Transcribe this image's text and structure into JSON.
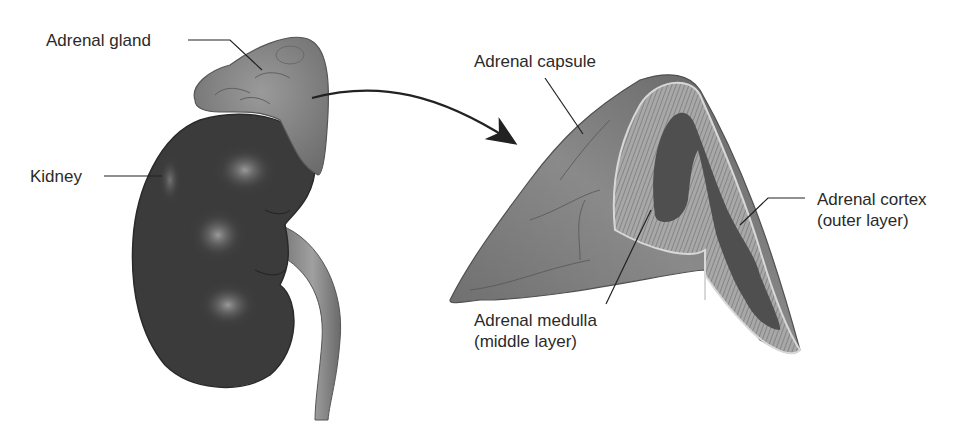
{
  "diagram": {
    "labels": {
      "adrenal_gland": "Adrenal gland",
      "kidney": "Kidney",
      "adrenal_capsule": "Adrenal capsule",
      "adrenal_cortex_line1": "Adrenal cortex",
      "adrenal_cortex_line2": "(outer layer)",
      "adrenal_medulla_line1": "Adrenal medulla",
      "adrenal_medulla_line2": "(middle layer)"
    },
    "colors": {
      "kidney": "#3a3a3a",
      "kidney_highlight": "#8a8a8a",
      "adrenal": "#7d7d7d",
      "adrenal_dark": "#5a5a5a",
      "cortex": "#9a9a9a",
      "medulla": "#4e4e4e",
      "leader_line": "#222222",
      "text": "#2a2a2a"
    }
  }
}
